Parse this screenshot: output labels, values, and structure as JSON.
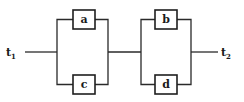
{
  "diagram": {
    "type": "series-parallel network",
    "terminals": {
      "input": {
        "label": "t",
        "subscript": "1"
      },
      "output": {
        "label": "t",
        "subscript": "2"
      }
    },
    "blocks": [
      {
        "name": "parallel-block-1",
        "components": [
          "a",
          "c"
        ]
      },
      {
        "name": "parallel-block-2",
        "components": [
          "b",
          "d"
        ]
      }
    ],
    "components": {
      "a": "a",
      "b": "b",
      "c": "c",
      "d": "d"
    }
  }
}
